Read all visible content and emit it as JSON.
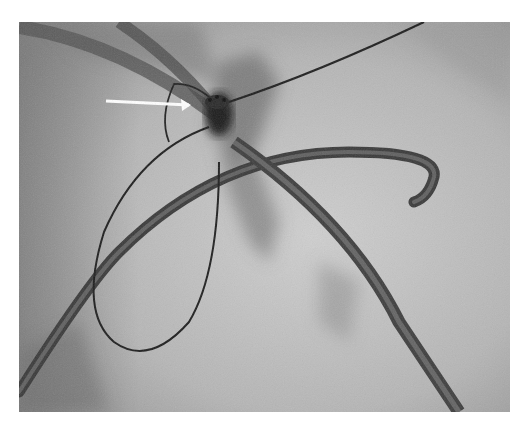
{
  "image": {
    "description": "Grayscale fluoroscopy (X-ray) image showing catheters, a guidewire loop and a device near center, with a white arrow pointing to the device",
    "annotations": [
      {
        "type": "arrow",
        "color": "#ffffff",
        "points_to": "device"
      }
    ],
    "colors": {
      "page_background": "#ffffff",
      "image_background": "#b4b4b4",
      "catheter": "#3a3a3a",
      "wire": "#1e1e1e",
      "arrow": "#ffffff"
    }
  }
}
